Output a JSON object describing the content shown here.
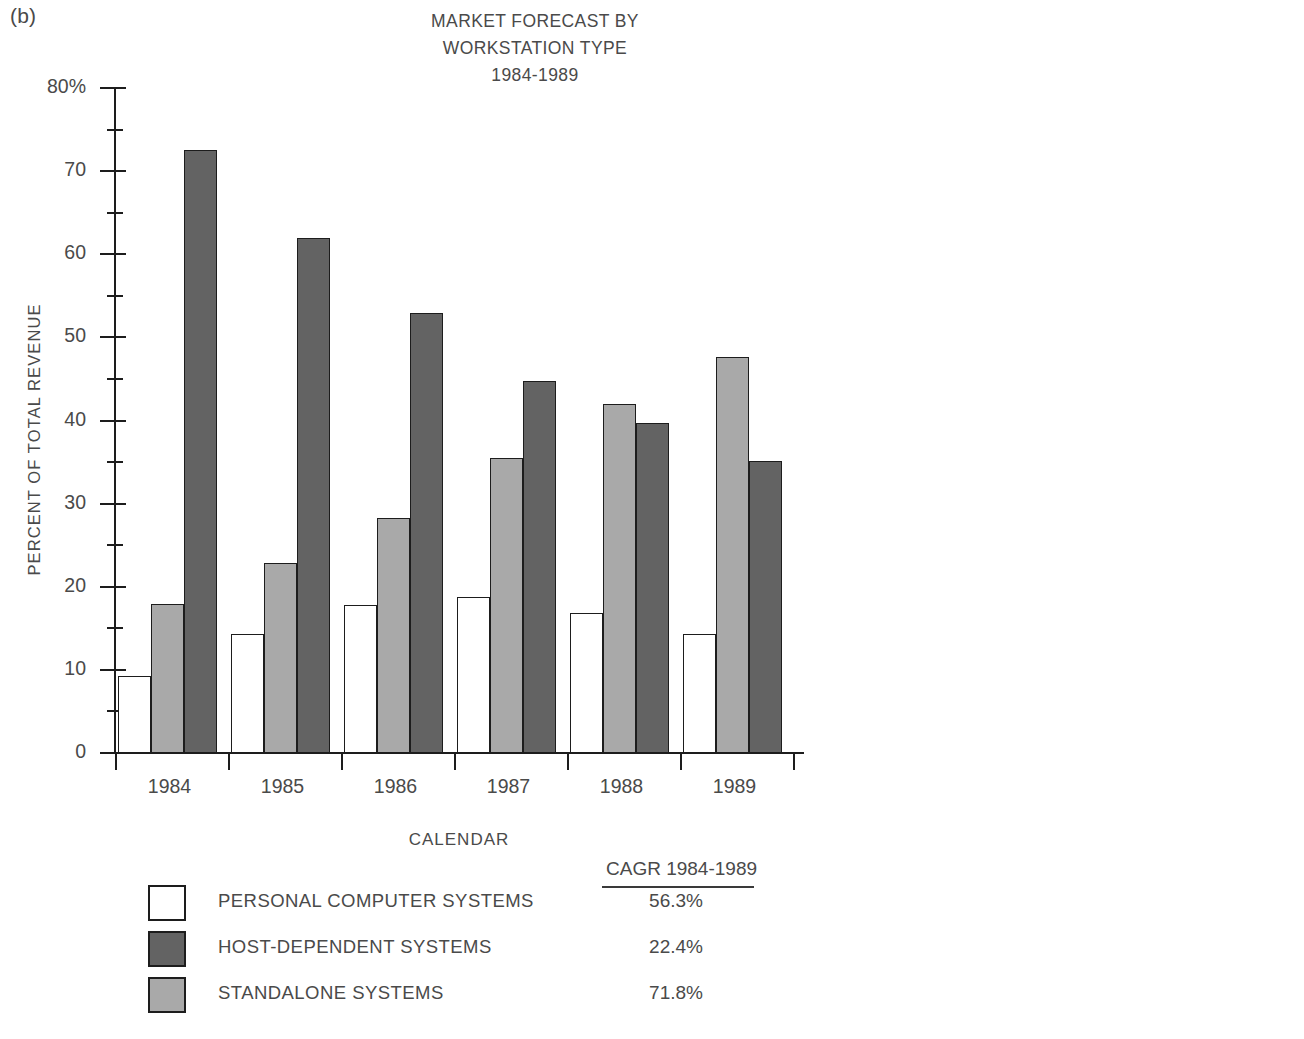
{
  "panel_label": "(b)",
  "axis": {
    "y_title": "PERCENT OF TOTAL REVENUE",
    "x_title": "CALENDAR",
    "y_ticks": [
      "80%",
      "70",
      "60",
      "50",
      "40",
      "30",
      "20",
      "10",
      "0"
    ]
  },
  "legend": {
    "cagr_header": "CAGR 1984-1989",
    "rows": [
      {
        "label": "PERSONAL COMPUTER SYSTEMS",
        "cagr": "56.3%",
        "swatch": "pc"
      },
      {
        "label": "HOST-DEPENDENT SYSTEMS",
        "cagr": "22.4%",
        "swatch": "host"
      },
      {
        "label": "STANDALONE SYSTEMS",
        "cagr": "71.8%",
        "swatch": "standalone"
      }
    ]
  },
  "colors": {
    "personal_computer_systems": "#ffffff",
    "host_dependent_systems": "#636363",
    "standalone_systems": "#a9a9a9",
    "axis": "#1d1d1d",
    "text": "#4a4a4a",
    "background": "#ffffff"
  },
  "chart_data": {
    "type": "bar",
    "title": "MARKET FORECAST BY WORKSTATION TYPE 1984-1989",
    "title_lines": [
      "MARKET FORECAST BY",
      "WORKSTATION TYPE",
      "1984-1989"
    ],
    "xlabel": "CALENDAR",
    "ylabel": "PERCENT OF TOTAL REVENUE",
    "ylim": [
      0,
      80
    ],
    "ytick_values": [
      0,
      10,
      20,
      30,
      40,
      50,
      60,
      70,
      80
    ],
    "yticks_minor_step": 5,
    "grid": false,
    "legend_position": "bottom-left",
    "categories": [
      "1984",
      "1985",
      "1986",
      "1987",
      "1988",
      "1989"
    ],
    "series": [
      {
        "name": "PERSONAL COMPUTER SYSTEMS",
        "color": "#ffffff",
        "cagr": "56.3%",
        "values": [
          9.3,
          14.3,
          17.8,
          18.8,
          16.8,
          14.3
        ]
      },
      {
        "name": "STANDALONE SYSTEMS",
        "color": "#a9a9a9",
        "cagr": "71.8%",
        "values": [
          17.9,
          22.8,
          28.3,
          35.5,
          42.0,
          47.6
        ]
      },
      {
        "name": "HOST-DEPENDENT SYSTEMS",
        "color": "#636363",
        "cagr": "22.4%",
        "values": [
          72.5,
          61.9,
          52.9,
          44.8,
          39.7,
          35.1
        ]
      }
    ]
  }
}
